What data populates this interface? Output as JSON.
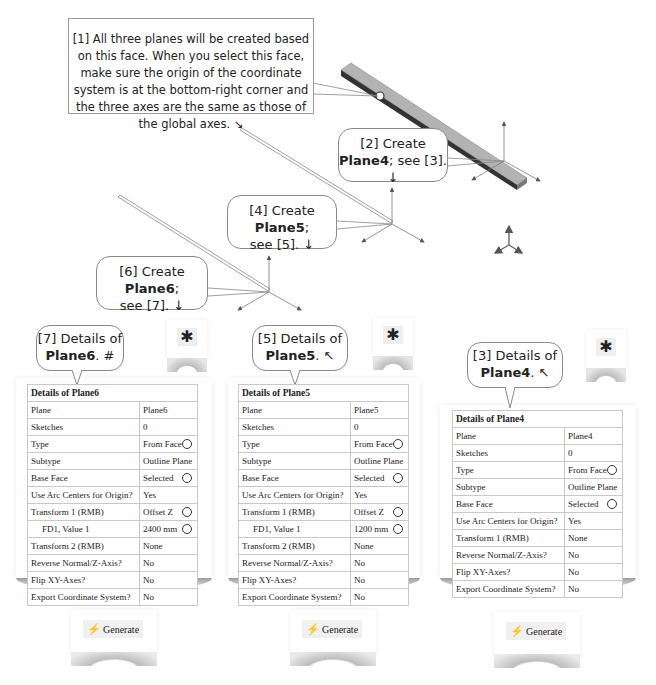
{
  "annotations": {
    "note1": "[1] All three planes will be created based on this face. When you select this face, make sure the origin of the coordinate system is at the bottom-right corner and the three axes are the same as those of the global axes. ↘",
    "step2": {
      "prefix": "[2] Create",
      "bold": "Plane4",
      "suffix": "; see [3]. ↓"
    },
    "step4": {
      "prefix": "[4] Create ",
      "bold": "Plane5",
      "suffix": ";",
      "line2": "see [5]. ↓"
    },
    "step6": {
      "prefix": "[6] Create ",
      "bold": "Plane6",
      "suffix": ";",
      "line2": "see [7]. ↓"
    },
    "step7": {
      "prefix": "[7] Details of",
      "bold": "Plane6",
      "suffix": ". #"
    },
    "step5": {
      "prefix": "[5] Details of",
      "bold": "Plane5",
      "suffix": ". ↖"
    },
    "step3": {
      "prefix": "[3] Details of",
      "bold": "Plane4",
      "suffix": ". ↖"
    }
  },
  "toolbar": {
    "icon": "new-plane-icon",
    "glyph": "✱"
  },
  "generate": {
    "label": "Generate",
    "icon_glyph": "⚡"
  },
  "details_plane6": {
    "title": "Details of Plane6",
    "rows": [
      {
        "label": "Plane",
        "value": "Plane6",
        "radio": false
      },
      {
        "label": "Sketches",
        "value": "0",
        "radio": false
      },
      {
        "label": "Type",
        "value": "From Face",
        "radio": true
      },
      {
        "label": "Subtype",
        "value": "Outline Plane",
        "radio": false
      },
      {
        "label": "Base Face",
        "value": "Selected",
        "radio": true
      },
      {
        "label": "Use Arc Centers for Origin?",
        "value": "Yes",
        "radio": false
      },
      {
        "label": "Transform 1 (RMB)",
        "value": "Offset Z",
        "radio": true
      },
      {
        "label": "FD1, Value 1",
        "value": "2400 mm",
        "radio": true
      },
      {
        "label": "Transform 2 (RMB)",
        "value": "None",
        "radio": false
      },
      {
        "label": "Reverse Normal/Z-Axis?",
        "value": "No",
        "radio": false
      },
      {
        "label": "Flip XY-Axes?",
        "value": "No",
        "radio": false
      },
      {
        "label": "Export Coordinate System?",
        "value": "No",
        "radio": false
      }
    ]
  },
  "details_plane5": {
    "title": "Details of Plane5",
    "rows": [
      {
        "label": "Plane",
        "value": "Plane5",
        "radio": false
      },
      {
        "label": "Sketches",
        "value": "0",
        "radio": false
      },
      {
        "label": "Type",
        "value": "From Face",
        "radio": true
      },
      {
        "label": "Subtype",
        "value": "Outline Plane",
        "radio": false
      },
      {
        "label": "Base Face",
        "value": "Selected",
        "radio": true
      },
      {
        "label": "Use Arc Centers for Origin?",
        "value": "Yes",
        "radio": false
      },
      {
        "label": "Transform 1 (RMB)",
        "value": "Offset Z",
        "radio": true
      },
      {
        "label": "FD1, Value 1",
        "value": "1200 mm",
        "radio": true
      },
      {
        "label": "Transform 2 (RMB)",
        "value": "None",
        "radio": false
      },
      {
        "label": "Reverse Normal/Z-Axis?",
        "value": "No",
        "radio": false
      },
      {
        "label": "Flip XY-Axes?",
        "value": "No",
        "radio": false
      },
      {
        "label": "Export Coordinate System?",
        "value": "No",
        "radio": false
      }
    ]
  },
  "details_plane4": {
    "title": "Details of Plane4",
    "rows": [
      {
        "label": "Plane",
        "value": "Plane4",
        "radio": false
      },
      {
        "label": "Sketches",
        "value": "0",
        "radio": false
      },
      {
        "label": "Type",
        "value": "From Face",
        "radio": true
      },
      {
        "label": "Subtype",
        "value": "Outline Plane",
        "radio": false
      },
      {
        "label": "Base Face",
        "value": "Selected",
        "radio": true
      },
      {
        "label": "Use Arc Centers for Origin?",
        "value": "Yes",
        "radio": false
      },
      {
        "label": "Transform 1 (RMB)",
        "value": "None",
        "radio": false
      },
      {
        "label": "Reverse Normal/Z-Axis?",
        "value": "No",
        "radio": false
      },
      {
        "label": "Flip XY-Axes?",
        "value": "No",
        "radio": false
      },
      {
        "label": "Export Coordinate System?",
        "value": "No",
        "radio": false
      }
    ]
  }
}
